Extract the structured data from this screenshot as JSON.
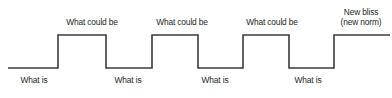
{
  "diagram": {
    "type": "square-wave-step-diagram",
    "title": "",
    "line_color": "#3b3b3b",
    "text_color": "#231f20",
    "background_color": "#ffffff",
    "high_labels": [
      {
        "text": "What could be",
        "center_x": 92,
        "y": 18
      },
      {
        "text": "What could be",
        "center_x": 182,
        "y": 18
      },
      {
        "text": "What could be",
        "center_x": 272,
        "y": 18
      }
    ],
    "low_labels": [
      {
        "text": "What is",
        "center_x": 34,
        "y": 76
      },
      {
        "text": "What is",
        "center_x": 128,
        "y": 76
      },
      {
        "text": "What is",
        "center_x": 215,
        "y": 76
      },
      {
        "text": "What is",
        "center_x": 308,
        "y": 76
      }
    ],
    "end_label": {
      "line1": "New bliss",
      "line2": "(new norm)",
      "center_x": 361,
      "y": 8
    },
    "waveform": {
      "low_y": 68,
      "high_y": 35,
      "x_start": 8,
      "x_end": 390,
      "transitions": [
        58,
        106,
        152,
        198,
        243,
        289,
        334
      ],
      "stroke_width": 1.6,
      "points": "8,68 58,68 58,35 106,35 106,68 152,68 152,35 198,35 198,68 243,68 243,35 289,35 289,68 334,68 334,35 390,35"
    }
  }
}
